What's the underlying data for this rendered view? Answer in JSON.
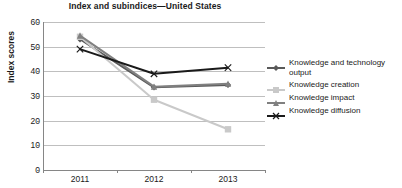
{
  "chart_data": {
    "type": "line",
    "title": "Index and subindices—United States",
    "xlabel": "",
    "ylabel": "Index scores",
    "categories": [
      "2011",
      "2012",
      "2013"
    ],
    "ylim": [
      0,
      60
    ],
    "yticks": [
      0,
      10,
      20,
      30,
      40,
      50,
      60
    ],
    "grid": true,
    "legend_position": "right",
    "series": [
      {
        "name": "Knowledge and technology output",
        "values": [
          53.0,
          33.5,
          34.5
        ],
        "color": "#595959",
        "marker": "diamond"
      },
      {
        "name": "Knowledge creation",
        "values": [
          54.0,
          28.5,
          16.5
        ],
        "color": "#c9c9c9",
        "marker": "square"
      },
      {
        "name": "Knowledge impact",
        "values": [
          54.5,
          33.8,
          35.0
        ],
        "color": "#808080",
        "marker": "triangle"
      },
      {
        "name": "Knowledge diffusion",
        "values": [
          49.0,
          39.0,
          41.5
        ],
        "color": "#1a1a1a",
        "marker": "x"
      }
    ]
  },
  "axes": {
    "y_title": "Index scores",
    "y_tick_labels": [
      "60",
      "50",
      "40",
      "30",
      "20",
      "10",
      "0"
    ],
    "x_tick_labels": [
      "2011",
      "2012",
      "2013"
    ]
  },
  "legend": {
    "items": [
      {
        "label": "Knowledge and technology output"
      },
      {
        "label": "Knowledge creation"
      },
      {
        "label": "Knowledge impact"
      },
      {
        "label": "Knowledge diffusion"
      }
    ]
  }
}
